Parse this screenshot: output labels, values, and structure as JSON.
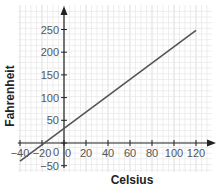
{
  "chart_data": {
    "type": "line",
    "title": "",
    "xlabel": "Celsius",
    "ylabel": "Fahrenheit",
    "x_ticks": [
      -40,
      -20,
      0,
      20,
      40,
      60,
      80,
      100,
      120
    ],
    "x_tick_labels": [
      "−40",
      "−20",
      "0",
      "20",
      "40",
      "60",
      "80",
      "100",
      "120"
    ],
    "y_ticks": [
      -50,
      0,
      50,
      100,
      150,
      200,
      250
    ],
    "y_tick_labels": [
      "−50",
      "0",
      "50",
      "100",
      "150",
      "200",
      "250"
    ],
    "xlim": [
      -44,
      132
    ],
    "ylim": [
      -60,
      290
    ],
    "grid": true,
    "series": [
      {
        "name": "F = 1.8C + 32",
        "x": [
          -40,
          120
        ],
        "y": [
          -40,
          248
        ]
      }
    ],
    "colors": {
      "line": "#555555",
      "grid": "#d9d9d9",
      "axis": "#222222"
    }
  }
}
